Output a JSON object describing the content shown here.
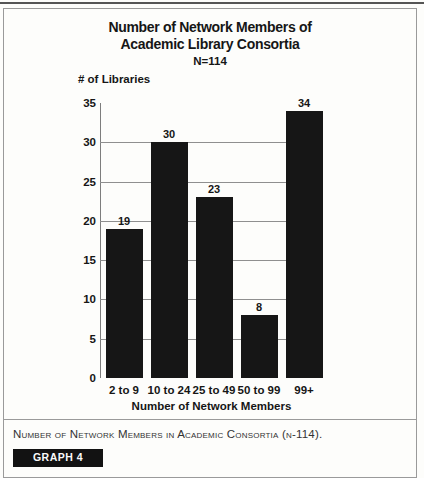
{
  "figure": {
    "title_line1": "Number of Network Members of",
    "title_line2": "Academic Library Consortia",
    "subtitle": "N=114",
    "y_axis_label": "# of Libraries",
    "x_axis_label": "Number of Network Members",
    "caption": "Number of Network Members in Academic Consortia (n-114).",
    "graph_label": "GRAPH 4"
  },
  "chart_data": {
    "type": "bar",
    "title": "Number of Network Members of Academic Library Consortia",
    "subtitle": "N=114",
    "categories": [
      "2 to 9",
      "10 to 24",
      "25 to 49",
      "50 to 99",
      "99+"
    ],
    "values": [
      19,
      30,
      23,
      8,
      34
    ],
    "xlabel": "Number of Network Members",
    "ylabel": "# of Libraries",
    "ylim": [
      0,
      35
    ],
    "yticks": [
      0,
      5,
      10,
      15,
      20,
      25,
      30,
      35
    ],
    "gridline_values": [
      5,
      10,
      15,
      20,
      25,
      30
    ],
    "grid_on": true,
    "legend_position": "none",
    "bar_color": "#161616",
    "grid_color": "#8f8f8f",
    "axis_color": "#7d7d7d"
  }
}
